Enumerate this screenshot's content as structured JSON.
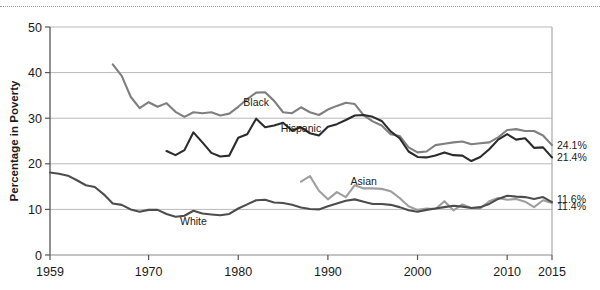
{
  "chart_data": {
    "type": "line",
    "title": "",
    "xlabel": "",
    "ylabel": "Percentage in Poverty",
    "xlim": [
      1959,
      2015
    ],
    "ylim": [
      0,
      50
    ],
    "xticks": [
      1959,
      1970,
      1980,
      1990,
      2000,
      2010,
      2015
    ],
    "yticks": [
      0,
      10,
      20,
      30,
      40,
      50
    ],
    "grid": "horizontal",
    "legend_position": "inline-labels",
    "series": [
      {
        "name": "Black",
        "color": "#7f7f7f",
        "end_label": "24.1%",
        "label_x": 1982,
        "label_y": 32.6,
        "x": [
          1966,
          1967,
          1968,
          1969,
          1970,
          1971,
          1972,
          1973,
          1974,
          1975,
          1976,
          1977,
          1978,
          1979,
          1980,
          1981,
          1982,
          1983,
          1984,
          1985,
          1986,
          1987,
          1988,
          1989,
          1990,
          1991,
          1992,
          1993,
          1994,
          1995,
          1996,
          1997,
          1998,
          1999,
          2000,
          2001,
          2002,
          2003,
          2004,
          2005,
          2006,
          2007,
          2008,
          2009,
          2010,
          2011,
          2012,
          2013,
          2014,
          2015
        ],
        "y": [
          41.8,
          39.3,
          34.7,
          32.2,
          33.5,
          32.5,
          33.3,
          31.4,
          30.3,
          31.3,
          31.1,
          31.3,
          30.6,
          31.0,
          32.5,
          34.2,
          35.6,
          35.7,
          33.8,
          31.3,
          31.1,
          32.4,
          31.3,
          30.7,
          31.9,
          32.7,
          33.4,
          33.1,
          30.6,
          29.3,
          28.4,
          26.5,
          26.1,
          23.6,
          22.5,
          22.7,
          24.1,
          24.4,
          24.7,
          24.9,
          24.3,
          24.5,
          24.7,
          25.8,
          27.4,
          27.6,
          27.2,
          27.2,
          26.2,
          24.1
        ]
      },
      {
        "name": "Hispanic",
        "color": "#2b2b2b",
        "end_label": "21.4%",
        "label_x": 1987,
        "label_y": 26.9,
        "x": [
          1972,
          1973,
          1974,
          1975,
          1976,
          1977,
          1978,
          1979,
          1980,
          1981,
          1982,
          1983,
          1984,
          1985,
          1986,
          1987,
          1988,
          1989,
          1990,
          1991,
          1992,
          1993,
          1994,
          1995,
          1996,
          1997,
          1998,
          1999,
          2000,
          2001,
          2002,
          2003,
          2004,
          2005,
          2006,
          2007,
          2008,
          2009,
          2010,
          2011,
          2012,
          2013,
          2014,
          2015
        ],
        "y": [
          22.8,
          21.9,
          23.0,
          26.9,
          24.7,
          22.4,
          21.6,
          21.8,
          25.7,
          26.5,
          29.9,
          28.0,
          28.4,
          29.0,
          27.3,
          28.0,
          26.7,
          26.2,
          28.1,
          28.7,
          29.6,
          30.6,
          30.7,
          30.3,
          29.4,
          27.1,
          25.6,
          22.7,
          21.5,
          21.4,
          21.8,
          22.5,
          21.9,
          21.8,
          20.6,
          21.5,
          23.2,
          25.3,
          26.5,
          25.3,
          25.6,
          23.5,
          23.6,
          21.4
        ]
      },
      {
        "name": "Asian",
        "color": "#9e9e9e",
        "end_label": "11.4%",
        "label_x": 1994,
        "label_y": 15.3,
        "x": [
          1987,
          1988,
          1989,
          1990,
          1991,
          1992,
          1993,
          1994,
          1995,
          1996,
          1997,
          1998,
          1999,
          2000,
          2001,
          2002,
          2003,
          2004,
          2005,
          2006,
          2007,
          2008,
          2009,
          2010,
          2011,
          2012,
          2013,
          2014,
          2015
        ],
        "y": [
          16.1,
          17.3,
          14.1,
          12.2,
          13.8,
          12.7,
          15.3,
          14.6,
          14.6,
          14.5,
          14.0,
          12.5,
          10.7,
          9.9,
          10.2,
          10.1,
          11.8,
          9.8,
          11.1,
          10.3,
          10.2,
          11.8,
          12.5,
          12.1,
          12.3,
          11.7,
          10.5,
          12.0,
          11.4
        ]
      },
      {
        "name": "White",
        "color": "#4d4d4d",
        "end_label": "11.6%",
        "label_x": 1975,
        "label_y": 6.6,
        "x": [
          1959,
          1960,
          1961,
          1962,
          1963,
          1964,
          1965,
          1966,
          1967,
          1968,
          1969,
          1970,
          1971,
          1972,
          1973,
          1974,
          1975,
          1976,
          1977,
          1978,
          1979,
          1980,
          1981,
          1982,
          1983,
          1984,
          1985,
          1986,
          1987,
          1988,
          1989,
          1990,
          1991,
          1992,
          1993,
          1994,
          1995,
          1996,
          1997,
          1998,
          1999,
          2000,
          2001,
          2002,
          2003,
          2004,
          2005,
          2006,
          2007,
          2008,
          2009,
          2010,
          2011,
          2012,
          2013,
          2014,
          2015
        ],
        "y": [
          18.1,
          17.8,
          17.4,
          16.4,
          15.3,
          14.9,
          13.3,
          11.3,
          11.0,
          10.0,
          9.5,
          9.9,
          9.9,
          9.0,
          8.4,
          8.6,
          9.7,
          9.1,
          8.9,
          8.7,
          9.0,
          10.2,
          11.1,
          12.0,
          12.1,
          11.5,
          11.4,
          11.0,
          10.4,
          10.1,
          10.0,
          10.7,
          11.3,
          11.9,
          12.2,
          11.7,
          11.2,
          11.2,
          11.0,
          10.5,
          9.8,
          9.5,
          9.9,
          10.2,
          10.5,
          10.8,
          10.6,
          10.3,
          10.5,
          11.2,
          12.3,
          13.0,
          12.8,
          12.7,
          12.3,
          12.7,
          11.6
        ]
      }
    ]
  },
  "axis": {
    "ylabel": "Percentage in Poverty",
    "yticks": [
      "0",
      "10",
      "20",
      "30",
      "40",
      "50"
    ],
    "xticks": [
      "1959",
      "1970",
      "1980",
      "1990",
      "2000",
      "2010",
      "2015"
    ]
  }
}
